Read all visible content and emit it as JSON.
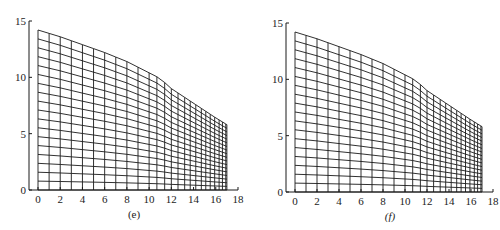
{
  "figure": {
    "panels": [
      {
        "id": "e",
        "caption": "(e)",
        "caption_italic": false,
        "offset_x": 0,
        "axis": {
          "x0_px": 38,
          "x18_px": 238,
          "y0_px": 190,
          "y15_px": 21,
          "yaxis_px": 29
        }
      },
      {
        "id": "f",
        "caption": "(f)",
        "caption_italic": true,
        "offset_x": 0,
        "axis": {
          "x0_px": 295,
          "x18_px": 493,
          "y0_px": 192,
          "y15_px": 23,
          "yaxis_px": 286
        }
      }
    ],
    "line_color": "#1a1a1a"
  },
  "chart_data": [
    {
      "type": "mesh",
      "title": "(e)",
      "xlabel": "",
      "ylabel": "",
      "xlim": [
        0,
        18
      ],
      "ylim": [
        0,
        15
      ],
      "x_ticks": [
        0,
        2,
        4,
        6,
        8,
        10,
        12,
        14,
        16,
        18
      ],
      "y_ticks": [
        0,
        5,
        10,
        15
      ],
      "grid_columns_x": [
        0,
        1,
        2,
        3,
        4,
        5,
        6,
        7,
        8,
        9,
        10,
        10.7,
        11.4,
        12,
        12.6,
        13.2,
        13.7,
        14.2,
        14.7,
        15.1,
        15.5,
        15.9,
        16.3,
        16.6,
        16.9,
        17
      ],
      "grid_rows": 18,
      "top_boundary": {
        "x": [
          0,
          2,
          4,
          6,
          8,
          10,
          11,
          12,
          14,
          16,
          17
        ],
        "y": [
          14.2,
          13.6,
          12.9,
          12.2,
          11.4,
          10.4,
          9.9,
          9.0,
          7.7,
          6.4,
          5.8
        ]
      },
      "bottom_boundary": {
        "y": 0
      }
    },
    {
      "type": "mesh",
      "title": "(f)",
      "xlabel": "",
      "ylabel": "",
      "xlim": [
        0,
        18
      ],
      "ylim": [
        0,
        15
      ],
      "x_ticks": [
        0,
        2,
        4,
        6,
        8,
        10,
        12,
        14,
        16,
        18
      ],
      "y_ticks": [
        0,
        5,
        10,
        15
      ],
      "grid_columns_x": [
        0,
        1,
        2,
        3,
        4,
        5,
        6,
        7,
        8,
        9,
        10,
        10.7,
        11.4,
        12,
        12.6,
        13.2,
        13.7,
        14.2,
        14.7,
        15.1,
        15.5,
        15.9,
        16.3,
        16.6,
        16.9,
        17
      ],
      "grid_rows": 18,
      "top_boundary": {
        "x": [
          0,
          2,
          4,
          6,
          8,
          10,
          11,
          12,
          14,
          16,
          17
        ],
        "y": [
          14.2,
          13.6,
          12.9,
          12.2,
          11.4,
          10.4,
          9.9,
          9.0,
          7.7,
          6.4,
          5.8
        ]
      },
      "bottom_boundary": {
        "y": 0
      }
    }
  ]
}
